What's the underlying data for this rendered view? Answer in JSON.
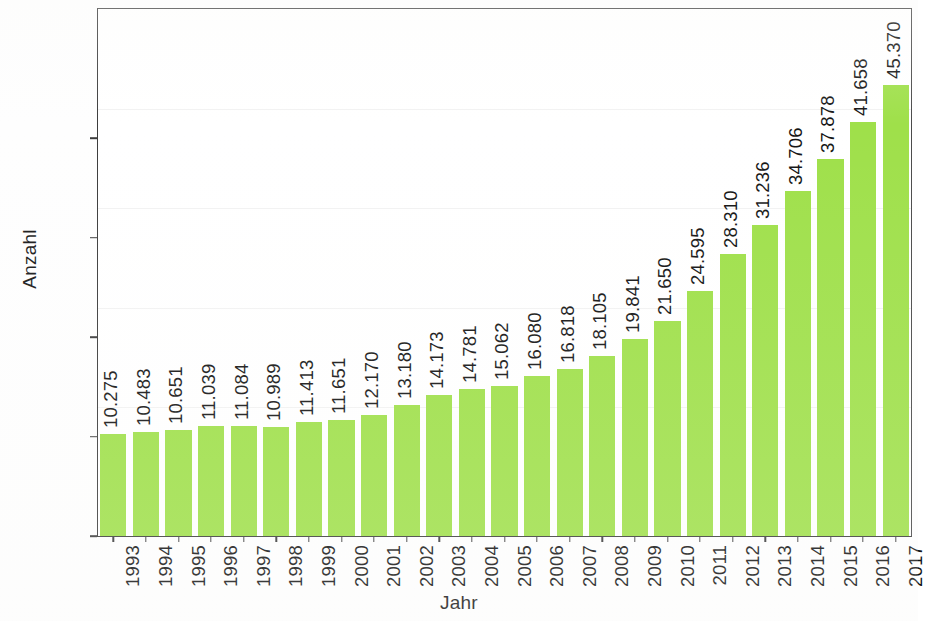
{
  "axes": {
    "y_title": "Anzahl",
    "x_title": "Jahr",
    "y_ticks": [
      "0",
      "10.000",
      "20.000",
      "30.000",
      "40.000"
    ]
  },
  "colors": {
    "bar": "#9fe04a",
    "frame": "#3c3c3c",
    "text": "#141414",
    "gridline": "#f2f2f2"
  },
  "chart_data": {
    "type": "bar",
    "title": "",
    "subtitle": "",
    "xlabel": "Jahr",
    "ylabel": "Anzahl",
    "ylim": [
      0,
      47500
    ],
    "yticks": [
      0,
      10000,
      20000,
      30000,
      40000
    ],
    "ytick_labels": [
      "0",
      "10.000",
      "20.000",
      "30.000",
      "40.000"
    ],
    "grid": true,
    "legend": null,
    "number_format": "de-DE (dot as thousands separator)",
    "categories": [
      "1993",
      "1994",
      "1995",
      "1996",
      "1997",
      "1998",
      "1999",
      "2000",
      "2001",
      "2002",
      "2003",
      "2004",
      "2005",
      "2006",
      "2007",
      "2008",
      "2009",
      "2010",
      "2011",
      "2012",
      "2013",
      "2014",
      "2015",
      "2016",
      "2017"
    ],
    "values": [
      10275,
      10483,
      10651,
      11039,
      11084,
      10989,
      11413,
      11651,
      12170,
      13180,
      14173,
      14781,
      15062,
      16080,
      16818,
      18105,
      19841,
      21650,
      24595,
      28310,
      31236,
      34706,
      37878,
      41658,
      45370
    ],
    "value_labels": [
      "10.275",
      "10.483",
      "10.651",
      "11.039",
      "11.084",
      "10.989",
      "11.413",
      "11.651",
      "12.170",
      "13.180",
      "14.173",
      "14.781",
      "15.062",
      "16.080",
      "16.818",
      "18.105",
      "19.841",
      "21.650",
      "24.595",
      "28.310",
      "31.236",
      "34.706",
      "37.878",
      "41.658",
      "45.370"
    ],
    "bar_color": "#9fe04a",
    "value_label_rotation": -90,
    "tick_label_rotation": -90
  }
}
